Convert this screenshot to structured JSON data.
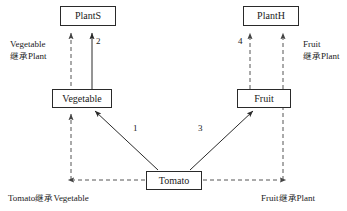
{
  "diagram": {
    "type": "uml-inheritance-diagram",
    "colors": {
      "stroke": "#2a2a2a",
      "dashed_stroke": "#555555",
      "text": "#1a1a1a",
      "background": "#ffffff"
    },
    "nodes": [
      {
        "id": "plants",
        "label": "PlantS",
        "x": 60,
        "y": 6,
        "w": 56,
        "h": 20
      },
      {
        "id": "planth",
        "label": "PlantH",
        "x": 243,
        "y": 6,
        "w": 56,
        "h": 20
      },
      {
        "id": "vegetable",
        "label": "Vegetable",
        "x": 52,
        "y": 89,
        "w": 60,
        "h": 19
      },
      {
        "id": "fruit",
        "label": "Fruit",
        "x": 237,
        "y": 89,
        "w": 54,
        "h": 19
      },
      {
        "id": "tomato",
        "label": "Tomato",
        "x": 146,
        "y": 171,
        "w": 56,
        "h": 19
      }
    ],
    "edge_numbers": [
      {
        "id": "edge-1",
        "label": "1",
        "x": 133,
        "y": 123
      },
      {
        "id": "edge-2",
        "label": "2",
        "x": 96,
        "y": 36
      },
      {
        "id": "edge-3",
        "label": "3",
        "x": 198,
        "y": 123
      },
      {
        "id": "edge-4",
        "label": "4",
        "x": 238,
        "y": 36
      }
    ],
    "annotations": [
      {
        "id": "vegetable-inherits-plant",
        "lines": [
          {
            "latin": "Vegetable",
            "cjk": ""
          },
          {
            "latin": "Plant",
            "cjk": "继承"
          }
        ],
        "x": 10,
        "y": 38,
        "align": "left"
      },
      {
        "id": "fruit-inherits-plant-right",
        "lines": [
          {
            "latin": "Fruit",
            "cjk": ""
          },
          {
            "latin": "Plant",
            "cjk": "继承"
          }
        ],
        "x": 303,
        "y": 38,
        "align": "left"
      },
      {
        "id": "tomato-inherits-vegetable",
        "lines": [
          {
            "latin": "Tomato",
            "cjk": "继承",
            "latin2": "Vegetable"
          }
        ],
        "x": 8,
        "y": 192,
        "align": "left"
      },
      {
        "id": "fruit-inherits-plant-bottom",
        "lines": [
          {
            "latin": "Fruit",
            "cjk": "继承",
            "latin2": "Plant"
          }
        ],
        "x": 261,
        "y": 192,
        "align": "left"
      }
    ]
  }
}
